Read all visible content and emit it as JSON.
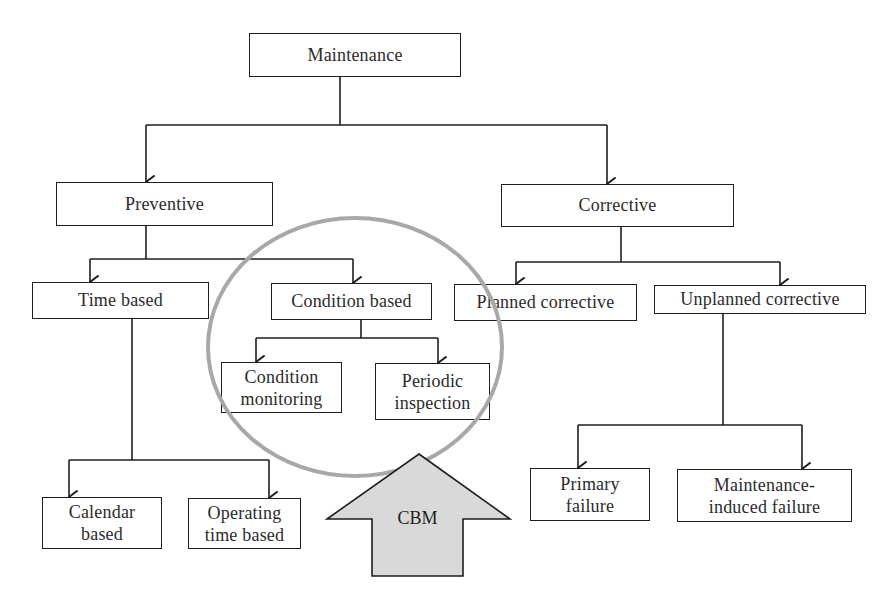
{
  "diagram": {
    "title": "Maintenance",
    "colors": {
      "line": "#1e1e1e",
      "highlight_circle": "#a8a8a8",
      "cbm_arrow_fill": "#d9d9d9",
      "background": "#ffffff"
    },
    "nodes": {
      "maintenance": {
        "label": "Maintenance"
      },
      "preventive": {
        "label": "Preventive"
      },
      "corrective": {
        "label": "Corrective"
      },
      "time_based": {
        "label": "Time based"
      },
      "condition_based": {
        "label": "Condition based"
      },
      "planned_corrective": {
        "label": "Planned corrective"
      },
      "unplanned_corrective": {
        "label": "Unplanned corrective"
      },
      "condition_monitoring": {
        "line1": "Condition",
        "line2": "monitoring"
      },
      "periodic_inspection": {
        "line1": "Periodic",
        "line2": "inspection"
      },
      "calendar_based": {
        "line1": "Calendar",
        "line2": "based"
      },
      "operating_time_based": {
        "line1": "Operating",
        "line2": "time based"
      },
      "primary_failure": {
        "line1": "Primary",
        "line2": "failure"
      },
      "maintenance_induced_failure": {
        "line1": "Maintenance-",
        "line2": "induced failure"
      }
    },
    "edges": [
      [
        "Maintenance",
        "Preventive"
      ],
      [
        "Maintenance",
        "Corrective"
      ],
      [
        "Preventive",
        "Time based"
      ],
      [
        "Preventive",
        "Condition based"
      ],
      [
        "Condition based",
        "Condition monitoring"
      ],
      [
        "Condition based",
        "Periodic inspection"
      ],
      [
        "Time based",
        "Calendar based"
      ],
      [
        "Time based",
        "Operating time based"
      ],
      [
        "Corrective",
        "Planned corrective"
      ],
      [
        "Corrective",
        "Unplanned corrective"
      ],
      [
        "Unplanned corrective",
        "Primary failure"
      ],
      [
        "Unplanned corrective",
        "Maintenance-induced failure"
      ]
    ],
    "highlight": {
      "encircles": [
        "Condition based",
        "Condition monitoring",
        "Periodic inspection"
      ],
      "arrow_label": "CBM"
    }
  }
}
